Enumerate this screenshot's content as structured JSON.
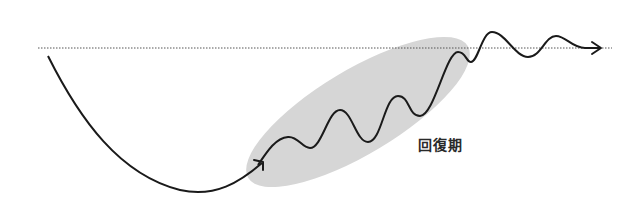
{
  "diagram": {
    "type": "recovery-curve",
    "baseline": {
      "style": "dotted",
      "color": "#555555"
    },
    "phases": [
      {
        "label": "回復期",
        "highlight_color": "#d6d6d6"
      }
    ],
    "curve": {
      "color": "#1a1a1a",
      "arrow": "right"
    }
  }
}
